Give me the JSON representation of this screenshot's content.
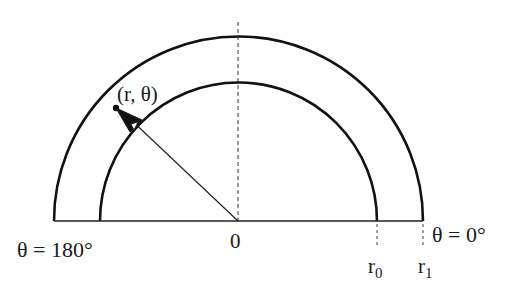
{
  "diagram": {
    "type": "polar-annulus",
    "center": {
      "x": 238,
      "y": 221
    },
    "radii": {
      "inner": 138,
      "outer": 185
    },
    "point_angle_deg": 140,
    "colors": {
      "stroke": "#111111",
      "background": "#ffffff"
    },
    "labels": {
      "point": "(r, θ)",
      "origin": "0",
      "theta_left": "θ = 180°",
      "theta_right": "θ = 0°",
      "r0_main": "r",
      "r0_sub": "0",
      "r1_main": "r",
      "r1_sub": "1"
    }
  }
}
